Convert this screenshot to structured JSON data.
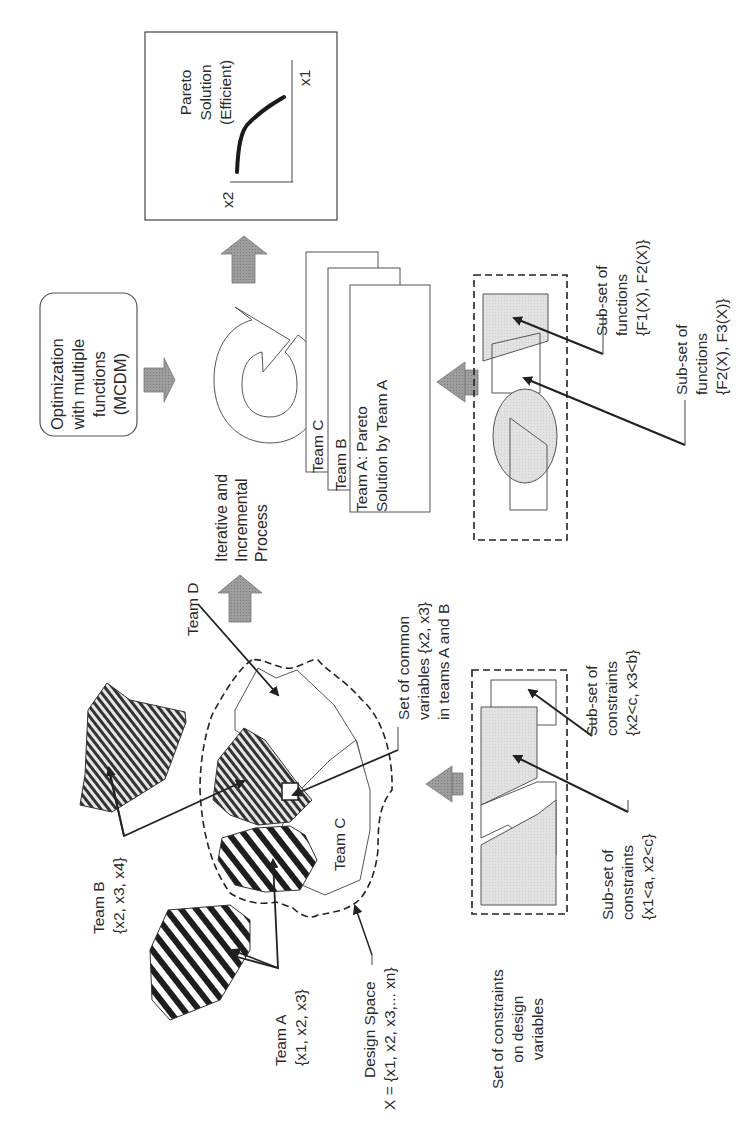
{
  "diagram": {
    "orientation": "rotated 90 degrees counter-clockwise",
    "colors": {
      "line": "#3a3a3a",
      "arrow_fill": "#9a9a9a",
      "shape_fill": "#dcdcdc",
      "hatch_dark": "#2a2a2a"
    },
    "pareto_box": {
      "title": "Pareto\nSolution\n(Efficient)",
      "x_axis_label": "x1",
      "y_axis_label": "x2"
    },
    "mcdm_box": {
      "label": "Optimization\nwith multiple\nfunctions\n(MCDM)"
    },
    "process_label": "Iterative and\nIncremental\nProcess",
    "team_solutions": {
      "team_c": "Team C",
      "team_b": "Team B",
      "team_a": "Team A: Pareto\nSolution by Team A"
    },
    "functions": {
      "subset_1": "Sub-set of\nfunctions\n{F1(X), F2(X)}",
      "subset_2": "Sub-set of\nfunctions\n{F2(X), F3(X)}"
    },
    "teams": {
      "team_d": "Team D",
      "team_c": "Team C",
      "team_b": "Team B\n{x2, x3, x4}",
      "team_a": "Team A\n{x1, x2, x3}"
    },
    "common_variables": "Set of common\nvariables {x2, x3}\nin teams A and B",
    "design_space": {
      "title": "Design Space",
      "formula": "X = {x1, x2, x3,... xn}"
    },
    "constraints": {
      "set_label": "Set of constraints\non design\nvariables",
      "subset_1": "Sub-set of\nconstraints\n{x1<a, x2<c}",
      "subset_2": "Sub-set of\nconstraints\n{x2<c, x3<b}"
    }
  }
}
